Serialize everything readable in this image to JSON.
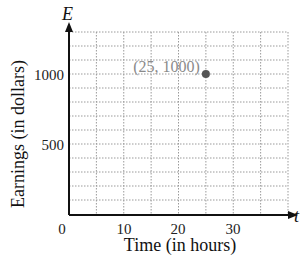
{
  "chart_data": {
    "type": "scatter",
    "title": "",
    "xlabel": "Time (in hours)",
    "ylabel": "Earnings (in dollars)",
    "x_variable": "t",
    "y_variable": "E",
    "x_ticks": [
      0,
      10,
      20,
      30
    ],
    "y_ticks": [
      500,
      1000
    ],
    "xlim": [
      0,
      40
    ],
    "ylim": [
      0,
      1300
    ],
    "x_grid_step": 5,
    "y_grid_step": 100,
    "grid": true,
    "legend": null,
    "points": [
      {
        "x": 25,
        "y": 1000,
        "label": "(25, 1000)"
      }
    ],
    "colors": {
      "point": "#555555",
      "point_label": "#8a8a8a",
      "grid": "#9a9a9a",
      "axis": "#111111"
    }
  },
  "labels": {
    "x_axis_title": "Time (in hours)",
    "y_axis_title": "Earnings (in dollars)",
    "x_var": "t",
    "y_var": "E",
    "origin": "0",
    "x_tick_10": "10",
    "x_tick_20": "20",
    "x_tick_30": "30",
    "y_tick_500": "500",
    "y_tick_1000": "1000",
    "point_label": "(25, 1000)"
  }
}
